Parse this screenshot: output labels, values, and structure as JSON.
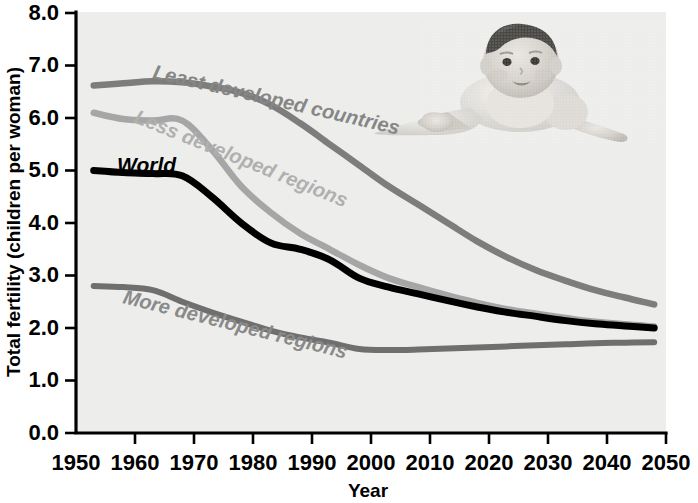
{
  "chart_data": {
    "type": "line",
    "title": "",
    "xlabel": "Year",
    "ylabel": "Total fertility (children per woman)",
    "xlim": [
      1950,
      2050
    ],
    "ylim": [
      0.0,
      8.0
    ],
    "grid": false,
    "legend_position": "inline-labels",
    "x_ticks": [
      "1950",
      "1960",
      "1970",
      "1980",
      "1990",
      "2000",
      "2010",
      "2020",
      "2030",
      "2040",
      "2050"
    ],
    "y_ticks": [
      "0.0",
      "1.0",
      "2.0",
      "3.0",
      "4.0",
      "5.0",
      "6.0",
      "7.0",
      "8.0"
    ],
    "x": [
      1953,
      1958,
      1963,
      1968,
      1973,
      1978,
      1983,
      1988,
      1993,
      1998,
      2003,
      2008,
      2013,
      2018,
      2023,
      2028,
      2033,
      2038,
      2043,
      2048
    ],
    "series": [
      {
        "name": "Least developed countries",
        "color": "#7d7d7d",
        "values": [
          6.62,
          6.66,
          6.7,
          6.68,
          6.6,
          6.48,
          6.25,
          5.9,
          5.5,
          5.1,
          4.7,
          4.35,
          4.0,
          3.65,
          3.35,
          3.1,
          2.9,
          2.72,
          2.58,
          2.45
        ]
      },
      {
        "name": "Less developed regions",
        "color": "#a6a6a6",
        "values": [
          6.1,
          5.98,
          5.95,
          5.95,
          5.4,
          4.7,
          4.2,
          3.8,
          3.5,
          3.2,
          2.95,
          2.78,
          2.62,
          2.48,
          2.36,
          2.27,
          2.19,
          2.12,
          2.07,
          2.03
        ]
      },
      {
        "name": "World",
        "color": "#000000",
        "values": [
          5.0,
          4.96,
          4.94,
          4.9,
          4.5,
          4.0,
          3.62,
          3.5,
          3.3,
          2.95,
          2.78,
          2.65,
          2.52,
          2.4,
          2.3,
          2.22,
          2.14,
          2.08,
          2.04,
          2.0
        ]
      },
      {
        "name": "More developed regions",
        "color": "#6f6f6f",
        "values": [
          2.8,
          2.78,
          2.72,
          2.5,
          2.3,
          2.12,
          1.95,
          1.82,
          1.72,
          1.6,
          1.58,
          1.59,
          1.61,
          1.63,
          1.65,
          1.67,
          1.69,
          1.71,
          1.72,
          1.73
        ]
      }
    ],
    "annotations": [
      {
        "text": "Least developed countries",
        "color": "#7d7d7d"
      },
      {
        "text": "Less developed regions",
        "color": "#a6a6a6"
      },
      {
        "text": "World",
        "color": "#000000"
      },
      {
        "text": "More developed regions",
        "color": "#6f6f6f"
      }
    ],
    "image": {
      "name": "baby-photo",
      "description": "crawling baby"
    }
  }
}
